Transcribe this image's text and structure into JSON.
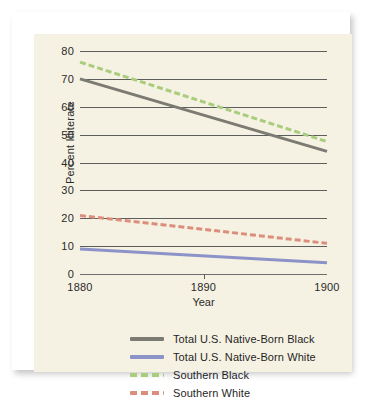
{
  "chart_data": {
    "type": "line",
    "title": "",
    "subtitle": "",
    "xlabel": "Year",
    "ylabel": "Percent Illiterate",
    "xlim": [
      1880,
      1900
    ],
    "ylim": [
      0,
      80
    ],
    "x": [
      1880,
      1900
    ],
    "xticks": [
      "1880",
      "1890",
      "1900"
    ],
    "xtick_values": [
      1880,
      1890,
      1900
    ],
    "yticks": [
      "0",
      "10",
      "20",
      "30",
      "40",
      "50",
      "60",
      "70",
      "80"
    ],
    "ytick_values": [
      0,
      10,
      20,
      30,
      40,
      50,
      60,
      70,
      80
    ],
    "grid": true,
    "grid_axis": "y",
    "legend_position": "bottom",
    "series": [
      {
        "name": "Total U.S. Native-Born Black",
        "values": [
          70,
          44
        ],
        "color": "#7b7b73",
        "style": "solid",
        "width": 3
      },
      {
        "name": "Total U.S. Native-Born White",
        "values": [
          9,
          4
        ],
        "color": "#8b93c9",
        "style": "solid",
        "width": 3
      },
      {
        "name": "Southern Black",
        "values": [
          76,
          47.5
        ],
        "color": "#a9cd7d",
        "style": "dashed",
        "width": 3
      },
      {
        "name": "Southern White",
        "values": [
          21,
          11
        ],
        "color": "#dc8e7d",
        "style": "dashed",
        "width": 3
      }
    ]
  },
  "legend": {
    "items": [
      {
        "label": "Total U.S. Native-Born Black",
        "color": "#7b7b73",
        "style": "solid"
      },
      {
        "label": "Total U.S. Native-Born White",
        "color": "#8b93c9",
        "style": "solid"
      },
      {
        "label": "Southern Black",
        "color": "#a9cd7d",
        "style": "dashed"
      },
      {
        "label": "Southern White",
        "color": "#dc8e7d",
        "style": "dashed"
      }
    ]
  },
  "colors": {
    "panel_background": "#f6f2e3",
    "card_background": "#ffffff",
    "page_background": "#ffffff",
    "gridline": "#5d5d5d",
    "text": "#2a2a2a"
  }
}
